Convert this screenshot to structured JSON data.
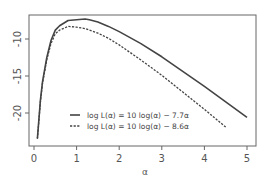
{
  "chart_data": {
    "type": "line",
    "title": "",
    "xlabel": "α",
    "ylabel": "",
    "xlim": [
      -0.1,
      5.2
    ],
    "ylim": [
      -24.5,
      -6.8
    ],
    "grid": false,
    "legend_position": "bottom-center-inside",
    "x_ticks": [
      0,
      1,
      2,
      3,
      4,
      5
    ],
    "y_ticks": [
      -10,
      -15,
      -20
    ],
    "x_tick_labels": [
      "0",
      "1",
      "2",
      "3",
      "4",
      "5"
    ],
    "y_tick_labels": [
      "-10",
      "-15",
      "-20"
    ],
    "series": [
      {
        "name": "log L(α) = 10 log(α) − 7.7α",
        "style": "solid",
        "color": "#444444",
        "x": [
          0.08,
          0.1,
          0.15,
          0.2,
          0.3,
          0.4,
          0.5,
          0.6,
          0.8,
          1.0,
          1.2,
          1.3,
          1.5,
          1.75,
          2.0,
          2.5,
          3.0,
          3.5,
          4.0,
          4.5,
          5.0
        ],
        "values": [
          -23.4,
          -21.9,
          -18.3,
          -15.8,
          -12.5,
          -10.2,
          -8.8,
          -8.2,
          -7.5,
          -7.4,
          -7.3,
          -7.4,
          -7.7,
          -8.3,
          -9.0,
          -10.6,
          -12.4,
          -14.4,
          -16.4,
          -18.5,
          -20.6
        ]
      },
      {
        "name": "log L(α) = 10 log(α) − 8.6α",
        "style": "dashed",
        "color": "#444444",
        "x": [
          0.08,
          0.1,
          0.15,
          0.2,
          0.3,
          0.4,
          0.5,
          0.6,
          0.8,
          1.0,
          1.2,
          1.5,
          1.75,
          2.0,
          2.5,
          3.0,
          3.5,
          4.0,
          4.5
        ],
        "values": [
          -23.5,
          -22.0,
          -18.5,
          -16.0,
          -12.8,
          -10.6,
          -9.3,
          -8.8,
          -8.3,
          -8.4,
          -8.6,
          -9.2,
          -9.9,
          -10.8,
          -12.8,
          -14.9,
          -17.2,
          -19.5,
          -21.9
        ]
      }
    ]
  },
  "legend": {
    "items": [
      {
        "label": "log L(α) = 10 log(α) − 7.7α"
      },
      {
        "label": "log L(α) = 10 log(α) − 8.6α"
      }
    ]
  },
  "axes": {
    "x_title": "α",
    "x_tick_labels": [
      "0",
      "1",
      "2",
      "3",
      "4",
      "5"
    ],
    "y_tick_labels": [
      "-10",
      "-15",
      "-20"
    ]
  }
}
